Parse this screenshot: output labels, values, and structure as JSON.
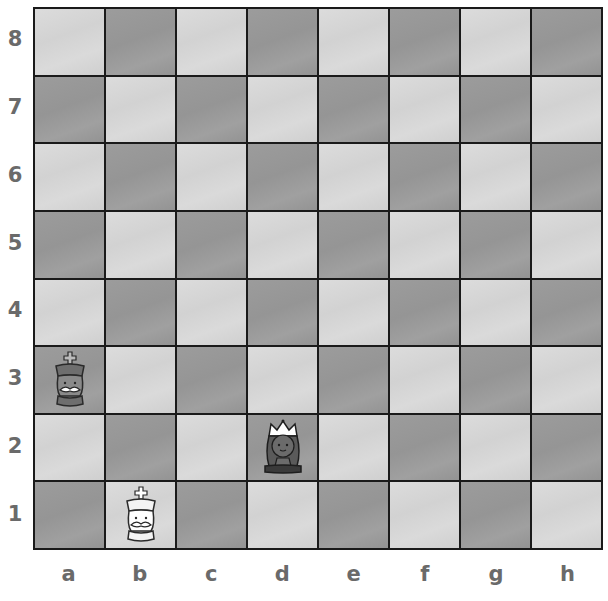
{
  "board": {
    "ranks": [
      "8",
      "7",
      "6",
      "5",
      "4",
      "3",
      "2",
      "1"
    ],
    "files": [
      "a",
      "b",
      "c",
      "d",
      "e",
      "f",
      "g",
      "h"
    ],
    "colors": {
      "light": "#d6d6d6",
      "dark": "#999999",
      "grid": "#1a1a1a",
      "label": "#6a6a6a"
    }
  },
  "pieces": [
    {
      "square": "a3",
      "type": "king",
      "color": "black",
      "icon": "black-king-icon"
    },
    {
      "square": "d2",
      "type": "queen",
      "color": "black",
      "icon": "black-queen-icon"
    },
    {
      "square": "b1",
      "type": "king",
      "color": "white",
      "icon": "white-king-icon"
    }
  ]
}
